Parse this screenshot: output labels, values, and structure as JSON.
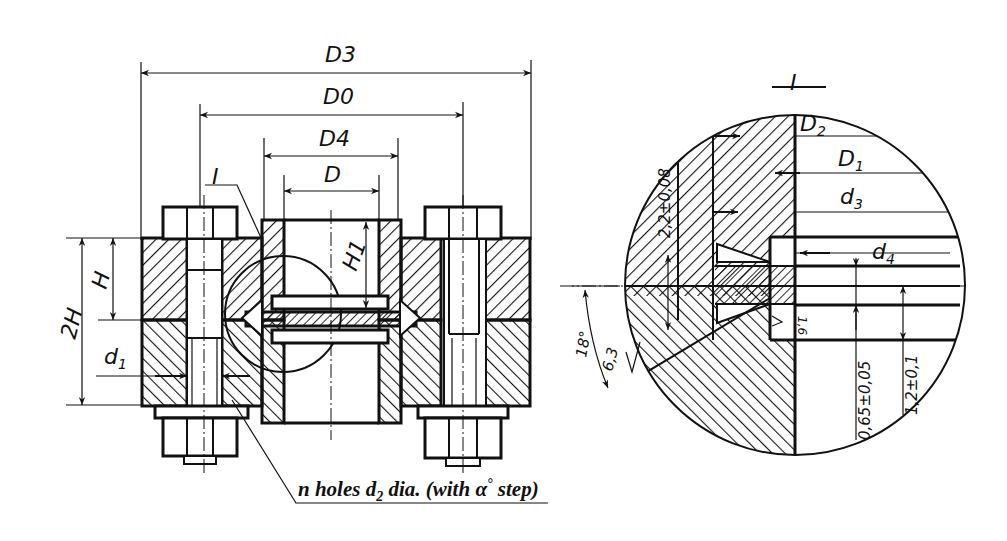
{
  "drawing": {
    "title": "Flange connection with lens gasket — section view and detail I",
    "main_view": {
      "dimensions": {
        "D3": "D3",
        "D0": "D0",
        "D4": "D4",
        "D": "D",
        "H": "H",
        "H1": "H1",
        "two_H": "2H",
        "d1": "d1"
      },
      "detail_callout": "I",
      "leader_note": {
        "text_before": "n holes d",
        "subscript": "2",
        "text_after": " dia. (with ",
        "alpha": "α",
        "degree": "°",
        "text_end": " step)"
      }
    },
    "detail_view": {
      "title": "I",
      "dimensions": {
        "D2": "D2",
        "D1": "D1",
        "d3": "d3",
        "d4": "d4",
        "tol_2_2": "2,2±0,08",
        "angle": "18°",
        "roughness": "6,3",
        "roughness_small": "1,6",
        "tol_0_65": "0,65±0,05",
        "tol_1_2": "1,2±0,1"
      }
    },
    "colors": {
      "ink": "#111111",
      "paper": "#ffffff"
    }
  }
}
